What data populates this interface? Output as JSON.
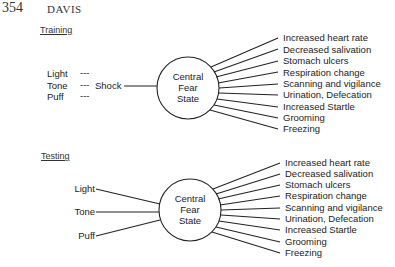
{
  "header": {
    "page_number": "354",
    "author": "DAVIS"
  },
  "training": {
    "title": "Training",
    "stimuli": [
      "Light",
      "Tone",
      "Puff"
    ],
    "pairing_dash": "---",
    "unconditioned": "Shock",
    "center": [
      "Central",
      "Fear",
      "State"
    ],
    "responses": [
      "Increased heart rate",
      "Decreased salivation",
      "Stomach ulcers",
      "Respiration change",
      "Scanning and vigilance",
      "Urination,  Defecation",
      "Increased Startle",
      "Grooming",
      "Freezing"
    ]
  },
  "testing": {
    "title": "Testing",
    "stimuli": [
      "Light",
      "Tone",
      "Puff"
    ],
    "center": [
      "Central",
      "Fear",
      "State"
    ],
    "responses": [
      "Increased heart rate",
      "Decreased salivation",
      "Stomach ulcers",
      "Respiration change",
      "Scanning and vigilance",
      "Urination,  Defecation",
      "Increased Startle",
      "Grooming",
      "Freezing"
    ]
  }
}
